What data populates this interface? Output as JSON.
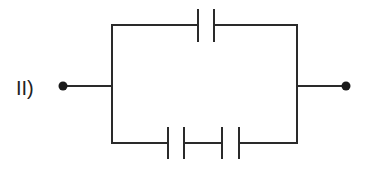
{
  "diagram": {
    "label": "II)",
    "type": "capacitor-network",
    "colors": {
      "line": "#2a2a2a",
      "background": "#ffffff"
    },
    "terminals": [
      {
        "name": "left-terminal",
        "x": 63,
        "y": 86
      },
      {
        "name": "right-terminal",
        "x": 346,
        "y": 86
      }
    ],
    "branches": [
      {
        "name": "top-branch",
        "capacitors": 1
      },
      {
        "name": "bottom-branch",
        "capacitors": 2
      }
    ]
  }
}
